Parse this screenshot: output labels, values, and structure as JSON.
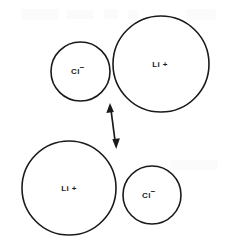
{
  "figure": {
    "background_color": "#ffffff",
    "stroke_color": "#1a1a1a",
    "width": 226,
    "height": 249
  },
  "ions": [
    {
      "id": "top-chloride",
      "element": "Cl",
      "charge": "−",
      "label": "Cl",
      "charge_symbol": "−",
      "cx": 80.5,
      "cy": 71.5,
      "r": 29.5,
      "label_x": 78,
      "label_y": 72
    },
    {
      "id": "top-lithium",
      "element": "Li",
      "charge": "+",
      "label": "Li +",
      "charge_symbol": "+",
      "cx": 161,
      "cy": 64,
      "r": 48,
      "label_x": 160,
      "label_y": 65
    },
    {
      "id": "bottom-lithium",
      "element": "Li",
      "charge": "+",
      "label": "Li +",
      "charge_symbol": "+",
      "cx": 69,
      "cy": 188,
      "r": 47,
      "label_x": 69,
      "label_y": 189
    },
    {
      "id": "bottom-chloride",
      "element": "Cl",
      "charge": "−",
      "label": "Cl",
      "charge_symbol": "−",
      "cx": 152,
      "cy": 195,
      "r": 29,
      "label_x": 149,
      "label_y": 196
    }
  ],
  "arrow": {
    "type": "double-headed",
    "x1": 110,
    "y1": 104,
    "x2": 116,
    "y2": 148,
    "color": "#1a1a1a"
  },
  "artifacts": {
    "description": "faint light-gray scan smudges along upper edge",
    "color": "#fbfbfc"
  }
}
